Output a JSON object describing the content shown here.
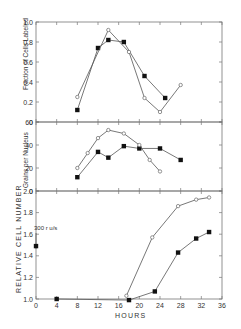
{
  "figure": {
    "xlabel": "HOURS",
    "x_ticks": [
      0,
      4,
      8,
      12,
      16,
      20,
      24,
      28,
      32,
      36
    ],
    "annotation": "300 r u/s"
  },
  "chart_data": [
    {
      "type": "line",
      "panel": "top",
      "title": "",
      "xlabel": "HOURS",
      "ylabel": "Fraction of Cells Labeled",
      "ylim": [
        0,
        1.0
      ],
      "y_ticks": [
        "0",
        "0.2",
        "0.4",
        "0.6",
        "0.8",
        "1.0"
      ],
      "xlim": [
        0,
        36
      ],
      "grid": false,
      "series": [
        {
          "name": "filled squares",
          "marker": "square-filled",
          "x": [
            8,
            12,
            14,
            17,
            21,
            25
          ],
          "y": [
            0.12,
            0.74,
            0.82,
            0.8,
            0.46,
            0.24
          ]
        },
        {
          "name": "open circles",
          "marker": "circle-open",
          "x": [
            8,
            14,
            18,
            21,
            24,
            28
          ],
          "y": [
            0.25,
            0.92,
            0.7,
            0.24,
            0.1,
            0.37
          ]
        }
      ]
    },
    {
      "type": "line",
      "panel": "middle",
      "ylabel": "Grains per Nucleus",
      "ylim": [
        0,
        60
      ],
      "y_ticks": [
        "0",
        "20",
        "40",
        "60"
      ],
      "xlim": [
        0,
        36
      ],
      "grid": false,
      "series": [
        {
          "name": "filled squares",
          "marker": "square-filled",
          "x": [
            8,
            12,
            14,
            17,
            20,
            24,
            28
          ],
          "y": [
            12,
            34,
            29,
            39,
            37,
            37,
            27
          ]
        },
        {
          "name": "open circles",
          "marker": "circle-open",
          "x": [
            8,
            10,
            12,
            14,
            17,
            20,
            22,
            24
          ],
          "y": [
            20,
            33,
            46,
            53,
            50,
            40,
            27,
            17
          ]
        }
      ]
    },
    {
      "type": "line",
      "panel": "bottom",
      "ylabel": "RELATIVE CELL NUMBER",
      "ylim": [
        1.0,
        2.0
      ],
      "y_ticks": [
        "1.0",
        "1.2",
        "1.4",
        "1.6",
        "1.8",
        "2.0"
      ],
      "xlim": [
        0,
        36
      ],
      "grid": false,
      "series": [
        {
          "name": "filled squares",
          "marker": "square-filled",
          "x": [
            4,
            18,
            23,
            27.5,
            31,
            33.5
          ],
          "y": [
            1.0,
            0.99,
            1.07,
            1.43,
            1.56,
            1.62
          ]
        },
        {
          "name": "open circles",
          "marker": "circle-open",
          "x": [
            17.5,
            22.5,
            27.5,
            31,
            33.5
          ],
          "y": [
            1.03,
            1.57,
            1.86,
            1.92,
            1.94
          ]
        }
      ],
      "annotations": [
        {
          "text": "300 r u/s",
          "x": 0,
          "y": 1.49,
          "arrow": "down"
        }
      ]
    }
  ]
}
